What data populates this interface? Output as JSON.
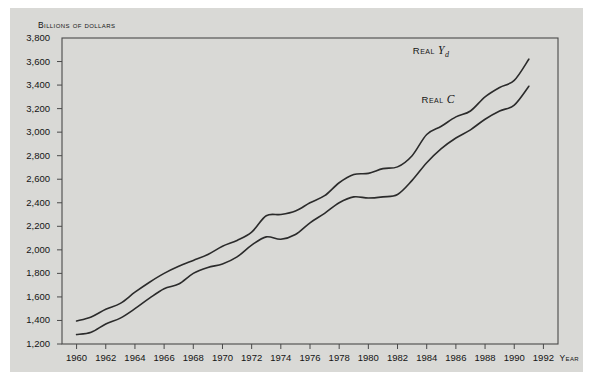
{
  "figure": {
    "background_color": "#d9d9d6",
    "frame_color": "#4a4a4a",
    "line_color": "#2b2b2b",
    "y_axis_title": "Billions of dollars",
    "x_axis_title": "Year"
  },
  "chart_data": {
    "type": "line",
    "title": "",
    "xlabel": "Year",
    "ylabel": "Billions of dollars",
    "xlim": [
      1959,
      1993
    ],
    "ylim": [
      1200,
      3800
    ],
    "grid": false,
    "legend_position": "inline-annotation",
    "y_ticks": [
      "3,800",
      "3,600",
      "3,400",
      "3,200",
      "3,000",
      "2,800",
      "2,600",
      "2,400",
      "2,200",
      "2,000",
      "1,800",
      "1,600",
      "1,400",
      "1,200"
    ],
    "y_tick_values": [
      3800,
      3600,
      3400,
      3200,
      3000,
      2800,
      2600,
      2400,
      2200,
      2000,
      1800,
      1600,
      1400,
      1200
    ],
    "x_ticks": [
      "1960",
      "1962",
      "1964",
      "1966",
      "1968",
      "1970",
      "1972",
      "1974",
      "1976",
      "1978",
      "1980",
      "1982",
      "1984",
      "1986",
      "1988",
      "1990",
      "1992"
    ],
    "x_tick_values": [
      1960,
      1962,
      1964,
      1966,
      1968,
      1970,
      1972,
      1974,
      1976,
      1978,
      1980,
      1982,
      1984,
      1986,
      1988,
      1990,
      1992
    ],
    "x": [
      1960,
      1961,
      1962,
      1963,
      1964,
      1965,
      1966,
      1967,
      1968,
      1969,
      1970,
      1971,
      1972,
      1973,
      1974,
      1975,
      1976,
      1977,
      1978,
      1979,
      1980,
      1981,
      1982,
      1983,
      1984,
      1985,
      1986,
      1987,
      1988,
      1989,
      1990,
      1991
    ],
    "series": [
      {
        "name": "Real Yd",
        "label_html": "Real <i>Y</i><sub>d</sub>",
        "label_plain": "REAL Yd",
        "label_x": 1986.2,
        "label_y": 3690,
        "values": [
          1395,
          1430,
          1495,
          1545,
          1640,
          1725,
          1800,
          1860,
          1910,
          1960,
          2030,
          2080,
          2150,
          2290,
          2300,
          2330,
          2400,
          2460,
          2570,
          2640,
          2650,
          2690,
          2705,
          2800,
          2980,
          3050,
          3130,
          3180,
          3300,
          3380,
          3440,
          3620
        ]
      },
      {
        "name": "Real C",
        "label_html": "Real <i>C</i>",
        "label_plain": "REAL C",
        "label_x": 1986.8,
        "label_y": 3270,
        "values": [
          1280,
          1300,
          1370,
          1420,
          1500,
          1590,
          1670,
          1710,
          1800,
          1850,
          1880,
          1940,
          2040,
          2110,
          2090,
          2130,
          2230,
          2310,
          2400,
          2450,
          2440,
          2450,
          2470,
          2590,
          2740,
          2860,
          2950,
          3020,
          3110,
          3180,
          3230,
          3390
        ]
      }
    ]
  }
}
